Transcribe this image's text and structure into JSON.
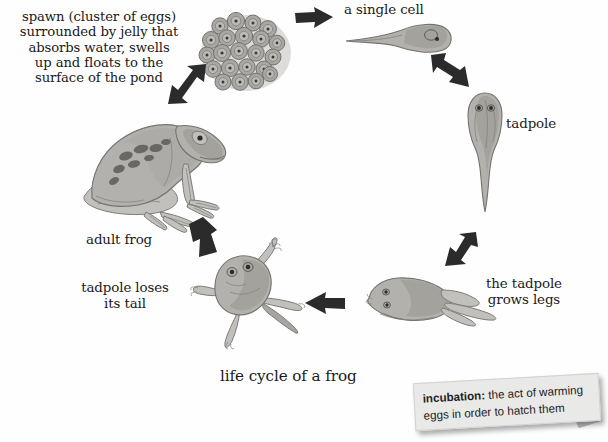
{
  "page": {
    "title": "life cycle of a frog",
    "background_color": "#fefefe",
    "text_color": "#1a1a1a"
  },
  "diagram": {
    "title": "life cycle of a frog",
    "stages": [
      {
        "id": "spawn",
        "label": "spawn (cluster of eggs)\nsurrounded by jelly that\nabsorbs water, swells\nup and floats to the\nsurface of the pond",
        "illustration": "frog-spawn-cluster-illustration"
      },
      {
        "id": "single-cell",
        "label": "a single cell",
        "illustration": "single-cell-embryo-illustration"
      },
      {
        "id": "tadpole",
        "label": "tadpole",
        "illustration": "tadpole-illustration"
      },
      {
        "id": "grows-legs",
        "label": "the tadpole\ngrows legs",
        "illustration": "tadpole-with-legs-illustration"
      },
      {
        "id": "loses-tail",
        "label": "tadpole loses\nits tail",
        "illustration": "froglet-illustration"
      },
      {
        "id": "adult-frog",
        "label": "adult frog",
        "illustration": "adult-frog-illustration"
      }
    ],
    "arrows": [
      {
        "id": "arrow-spawn-to-single-cell",
        "direction": "right"
      },
      {
        "id": "arrow-single-cell-to-tadpole",
        "direction": "down-right"
      },
      {
        "id": "arrow-tadpole-to-grows-legs",
        "direction": "down-left"
      },
      {
        "id": "arrow-grows-legs-to-loses-tail",
        "direction": "left"
      },
      {
        "id": "arrow-loses-tail-to-adult-frog",
        "direction": "up-left"
      },
      {
        "id": "arrow-adult-frog-to-spawn",
        "direction": "up-right"
      }
    ]
  },
  "note": {
    "term": "incubation:",
    "definition": " the act of warming eggs in order to hatch them"
  }
}
